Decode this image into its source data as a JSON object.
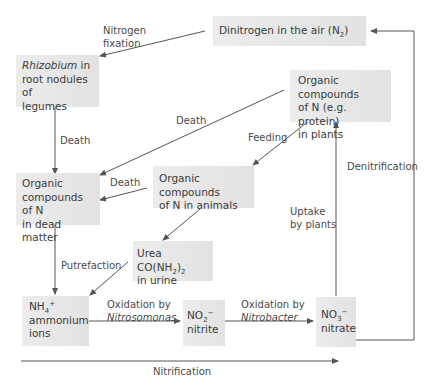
{
  "diagram": {
    "nodes": {
      "dinitrogen": {
        "text": "Dinitrogen in the air (N",
        "sub": "2",
        "tail": ")"
      },
      "rhizobium": {
        "italic": "Rhizobium",
        "text1": " in",
        "text2": "root nodules of",
        "text3": "legumes"
      },
      "plants": {
        "line1": "Organic compounds",
        "line2": "of N (e.g. protein)",
        "line3": "in plants"
      },
      "dead_matter": {
        "line1": "Organic",
        "line2": "compounds of N",
        "line3": "in dead matter"
      },
      "animals": {
        "line1": "Organic compounds",
        "line2": "of N in animals"
      },
      "urea": {
        "text": "Urea CO(NH",
        "sub": "2",
        "tail": ")",
        "sub2": "2",
        "line2": "in urine"
      },
      "ammonium": {
        "formula": "NH",
        "sub": "4",
        "sup": "+",
        "line2": "ammonium",
        "line3": "ions"
      },
      "nitrite": {
        "formula": "NO",
        "sub": "2",
        "sup": "−",
        "line2": "nitrite"
      },
      "nitrate": {
        "formula": "NO",
        "sub": "3",
        "sup": "−",
        "line2": "nitrate"
      }
    },
    "edges": {
      "nitrogen_fixation": {
        "line1": "Nitrogen",
        "line2": "fixation"
      },
      "death_rhizobium": "Death",
      "death_plants": "Death",
      "death_animals": "Death",
      "feeding": "Feeding",
      "putrefaction": "Putrefaction",
      "oxidation_nitrosomonas": {
        "line1": "Oxidation by",
        "line2": "Nitrosomonas"
      },
      "oxidation_nitrobacter": {
        "line1": "Oxidation by",
        "line2": "Nitrobacter"
      },
      "uptake": {
        "line1": "Uptake",
        "line2": "by plants"
      },
      "denitrification": "Denitrification",
      "nitrification": "Nitrification"
    },
    "colors": {
      "box": "#e6e6e6",
      "line": "#555555",
      "text": "#3a3a3a"
    }
  }
}
